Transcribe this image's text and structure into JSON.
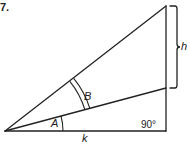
{
  "problem_number": "7.",
  "labels": {
    "angle_a": "A",
    "angle_b": "B",
    "height": "h",
    "base": "k",
    "right_angle": "90°"
  },
  "colors": {
    "stroke": "#222222",
    "background": "#ffffff"
  },
  "geometry": {
    "apex": [
      5,
      131
    ],
    "right_corner": [
      166,
      131
    ],
    "top_corner": [
      166,
      6
    ],
    "inner_point": [
      166,
      88
    ]
  }
}
